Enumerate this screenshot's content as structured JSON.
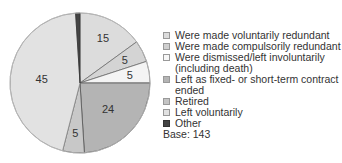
{
  "chart_data": {
    "type": "pie",
    "title": "",
    "categories": [
      "Were made voluntarily redundant",
      "Were made compulsorily redundant",
      "Were dismissed/left involuntarily (including death)",
      "Left as fixed- or short-term contract ended",
      "Retired",
      "Left voluntarily",
      "Other"
    ],
    "values": [
      15,
      5,
      5,
      24,
      5,
      45,
      1
    ],
    "value_labels": [
      "15",
      "5",
      "5",
      "24",
      "5",
      "45",
      ""
    ],
    "colors": [
      "#dcdcdc",
      "#d4d4d4",
      "#f4f4f4",
      "#b4b4b4",
      "#c8c8c8",
      "#e2e2e2",
      "#444444"
    ],
    "start_angle_deg": 0,
    "direction": "clockwise",
    "legend_position": "right",
    "base_note": "Base: 143"
  },
  "legend": {
    "items": [
      {
        "label": "Were made voluntarily redundant",
        "color": "#dcdcdc"
      },
      {
        "label": "Were made compulsorily redundant",
        "color": "#cfcfcf"
      },
      {
        "label": "Were dismissed/left involuntarily\n(including death)",
        "color": "#f7f7f7"
      },
      {
        "label": "Left as fixed- or short-term contract\nended",
        "color": "#b4b4b4"
      },
      {
        "label": "Retired",
        "color": "#c4c4c4"
      },
      {
        "label": "Left voluntarily",
        "color": "#e2e2e2"
      },
      {
        "label": "Other",
        "color": "#444444"
      }
    ],
    "base": "Base: 143"
  }
}
